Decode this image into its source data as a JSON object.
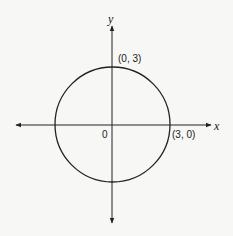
{
  "figure": {
    "axes": {
      "x_label": "x",
      "y_label": "y",
      "origin_label": "0"
    },
    "points": [
      {
        "label": "(0, 3)",
        "x": 0,
        "y": 3
      },
      {
        "label": "(3, 0)",
        "x": 3,
        "y": 0
      }
    ],
    "circle": {
      "center": [
        0,
        0
      ],
      "radius": 3
    },
    "colors": {
      "stroke": "#222222",
      "background": "#f7f7f5"
    }
  }
}
